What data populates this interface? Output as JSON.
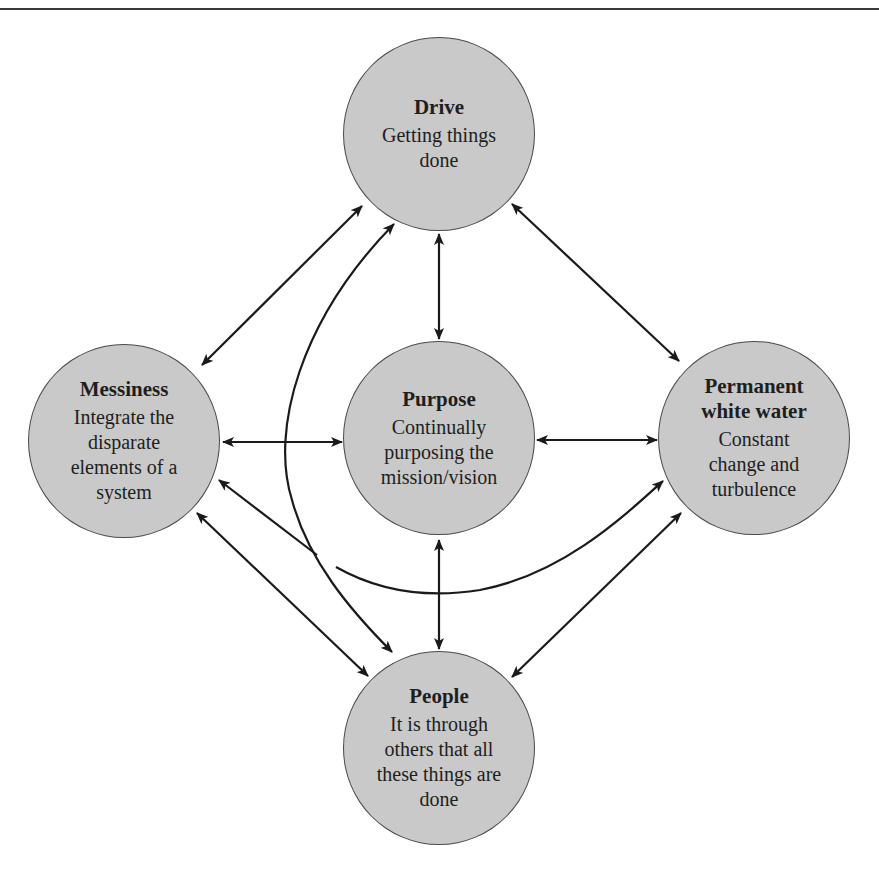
{
  "diagram": {
    "type": "relationship-diagram",
    "colors": {
      "node_fill": "#c9c9c9",
      "node_border": "#4a4a4a",
      "edge": "#1a1a1a",
      "background": "#ffffff"
    },
    "nodes": {
      "drive": {
        "title": "Drive",
        "desc_lines": [
          "Getting things",
          "done"
        ]
      },
      "messiness": {
        "title": "Messiness",
        "desc_lines": [
          "Integrate the",
          "disparate",
          "elements of a",
          "system"
        ]
      },
      "purpose": {
        "title": "Purpose",
        "desc_lines": [
          "Continually",
          "purposing the",
          "mission/vision"
        ]
      },
      "pww": {
        "title_lines": [
          "Permanent",
          "white water"
        ],
        "desc_lines": [
          "Constant",
          "change and",
          "turbulence"
        ]
      },
      "people": {
        "title": "People",
        "desc_lines": [
          "It is through",
          "others that all",
          "these things are",
          "done"
        ]
      }
    },
    "edges": [
      {
        "from": "Drive",
        "to": "Purpose",
        "direction": "both"
      },
      {
        "from": "Drive",
        "to": "Messiness",
        "direction": "both"
      },
      {
        "from": "Drive",
        "to": "Permanent white water",
        "direction": "both"
      },
      {
        "from": "Drive",
        "to": "People",
        "direction": "both",
        "curved": true
      },
      {
        "from": "Messiness",
        "to": "Purpose",
        "direction": "both"
      },
      {
        "from": "Purpose",
        "to": "Permanent white water",
        "direction": "both"
      },
      {
        "from": "Purpose",
        "to": "People",
        "direction": "both"
      },
      {
        "from": "Messiness",
        "to": "People",
        "direction": "both"
      },
      {
        "from": "Messiness",
        "to": "Permanent white water",
        "direction": "both",
        "curved": true
      },
      {
        "from": "People",
        "to": "Permanent white water",
        "direction": "both"
      }
    ]
  }
}
